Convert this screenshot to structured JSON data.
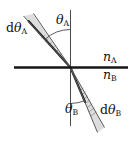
{
  "figure": {
    "kind": "optics-refraction-diagram",
    "background_color": "#ffffff",
    "line_color": "#1a1a1a",
    "ray_color": "#5a5a5a",
    "beam_fill_color": "#8c8c8c",
    "labels": {
      "incident_spread": {
        "d": "d",
        "theta": "θ",
        "sub": "A"
      },
      "incident_angle": {
        "theta": "θ",
        "sub": "A"
      },
      "medium_upper": {
        "n": "n",
        "sub": "A"
      },
      "medium_lower": {
        "n": "n",
        "sub": "B"
      },
      "refracted_angle": {
        "theta": "θ",
        "sub": "B"
      },
      "refracted_spread": {
        "d": "d",
        "theta": "θ",
        "sub": "B"
      }
    },
    "geometry": {
      "origin": {
        "x": 70.5,
        "y": 67.5
      },
      "interface_line": {
        "x1": 14,
        "y1": 67.5,
        "x2": 128,
        "y2": 67.5
      },
      "normal_line": {
        "x1": 70.5,
        "y1": 10,
        "x2": 70.5,
        "y2": 126
      },
      "incident_rays": [
        {
          "x1": 70.5,
          "y1": 67.5,
          "x2": 24,
          "y2": 16
        },
        {
          "x1": 70.5,
          "y1": 67.5,
          "x2": 33,
          "y2": 14
        }
      ],
      "refracted_rays": [
        {
          "x1": 70.5,
          "y1": 67.5,
          "x2": 98,
          "y2": 132
        },
        {
          "x1": 70.5,
          "y1": 67.5,
          "x2": 104,
          "y2": 128
        }
      ],
      "incident_angle_arc": {
        "cx": 70.5,
        "cy": 67.5,
        "r": 38,
        "from_deg": -90,
        "to_deg": -132
      },
      "refracted_angle_arc": {
        "cx": 70.5,
        "cy": 67.5,
        "r": 36,
        "from_deg": 90,
        "to_deg": 66
      }
    }
  }
}
